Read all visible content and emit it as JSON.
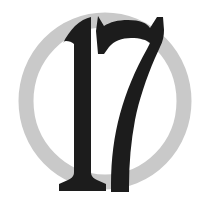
{
  "emblem": {
    "numeral_text": "17",
    "icon_names": {
      "ring": "circle-ring-icon",
      "numeral": "numeral-17-icon",
      "digit_one": "digit-one-icon",
      "digit_seven": "digit-seven-icon"
    },
    "colors": {
      "background": "#ffffff",
      "ring": "#c9c9c9",
      "ring_shadow": "#bdbdbd",
      "numeral": "#1c1c1c"
    },
    "geometry": {
      "canvas_width": 213,
      "canvas_height": 206,
      "ring_center_x": 105,
      "ring_center_y": 101,
      "ring_radius_x": 79,
      "ring_radius_y": 81,
      "ring_stroke_width": 15
    }
  }
}
